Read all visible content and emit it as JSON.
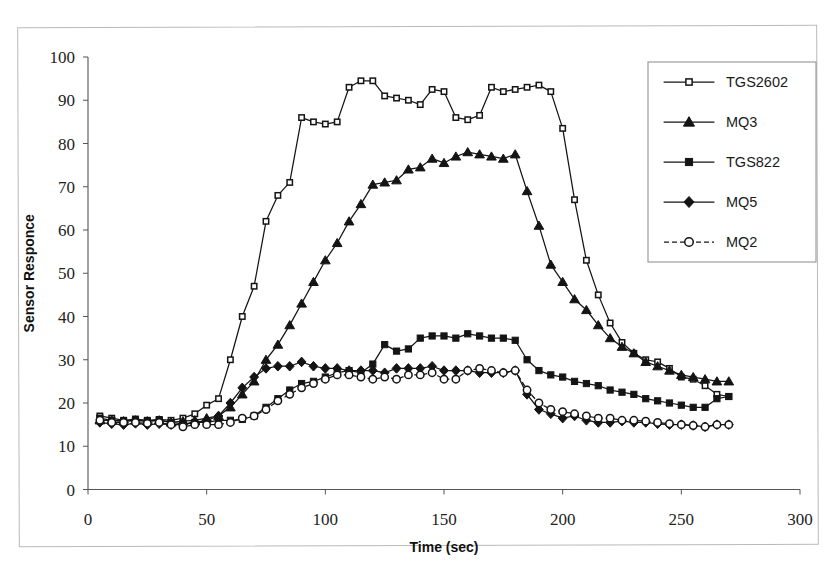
{
  "figure": {
    "name": "sensor-response-time-series",
    "has_outer_frame": true
  },
  "chart_data": {
    "type": "line",
    "title": "",
    "xlabel": "Time (sec)",
    "ylabel": "Sensor Responce",
    "xlim": [
      0,
      300
    ],
    "ylim": [
      0,
      100
    ],
    "xticks": [
      0,
      50,
      100,
      150,
      200,
      250,
      300
    ],
    "yticks": [
      0,
      10,
      20,
      30,
      40,
      50,
      60,
      70,
      80,
      90,
      100
    ],
    "grid": false,
    "legend_position": "upper-right-outside",
    "x": [
      5,
      10,
      15,
      20,
      25,
      30,
      35,
      40,
      45,
      50,
      55,
      60,
      65,
      70,
      75,
      80,
      85,
      90,
      95,
      100,
      105,
      110,
      115,
      120,
      125,
      130,
      135,
      140,
      145,
      150,
      155,
      160,
      165,
      170,
      175,
      180,
      185,
      190,
      195,
      200,
      205,
      210,
      215,
      220,
      225,
      230,
      235,
      240,
      245,
      250,
      255,
      260,
      265,
      270
    ],
    "series": [
      {
        "name": "TGS2602",
        "marker": "open-square",
        "linestyle": "solid",
        "color": "#141414",
        "values": [
          17,
          16.5,
          16,
          16.3,
          16,
          16.2,
          16,
          16.5,
          17.5,
          19.5,
          21,
          30,
          40,
          47,
          62,
          68,
          71,
          86,
          85,
          84.5,
          85,
          93,
          94.5,
          94.5,
          91,
          90.5,
          90,
          89,
          92.5,
          92,
          86,
          85.5,
          86.5,
          93,
          92,
          92.5,
          93,
          93.5,
          92,
          83.5,
          67,
          53,
          45,
          38.5,
          34,
          31.5,
          30,
          29.5,
          28,
          26,
          25.5,
          24,
          22,
          21.5
        ]
      },
      {
        "name": "MQ3",
        "marker": "filled-triangle",
        "linestyle": "solid",
        "color": "#141414",
        "values": [
          16,
          16,
          15.8,
          16,
          15.8,
          16,
          15.5,
          15.8,
          16,
          16.5,
          17,
          19,
          22,
          25,
          30,
          33.5,
          38,
          43,
          48,
          53,
          57,
          62,
          66,
          70.5,
          71,
          71.5,
          74,
          74.5,
          76.5,
          75.5,
          77,
          78,
          77.5,
          77,
          76.5,
          77.5,
          69,
          61,
          52,
          48,
          44,
          41.5,
          38,
          35,
          33,
          31.5,
          29.5,
          28.5,
          27.5,
          26.5,
          26,
          25.5,
          25,
          25
        ]
      },
      {
        "name": "TGS822",
        "marker": "filled-square",
        "linestyle": "solid",
        "color": "#141414",
        "values": [
          16.5,
          16,
          15.8,
          16,
          15.8,
          16,
          15.5,
          15.2,
          15.5,
          15.5,
          16,
          16,
          16.2,
          17,
          19,
          21,
          23,
          24.5,
          25,
          26,
          27,
          27.5,
          27,
          29,
          33.5,
          32,
          32.5,
          35,
          35.5,
          35.5,
          35,
          36,
          35.5,
          35,
          35,
          34.5,
          30,
          27.5,
          26.5,
          26,
          25,
          24.5,
          24,
          23,
          22.5,
          22,
          21,
          20.5,
          20,
          19.5,
          19,
          19,
          21,
          21.5
        ]
      },
      {
        "name": "MQ5",
        "marker": "filled-diamond",
        "linestyle": "solid",
        "color": "#141414",
        "values": [
          15.5,
          15.2,
          15,
          15.3,
          15,
          15.2,
          15,
          15,
          15.5,
          16,
          17,
          20,
          23.5,
          26,
          28,
          28.5,
          28.5,
          29.5,
          28.5,
          28,
          28,
          27.5,
          27.5,
          27.5,
          27,
          28,
          28,
          28,
          28.5,
          27.5,
          27.5,
          27.5,
          27,
          27,
          27,
          27.5,
          22,
          18.5,
          17.5,
          16.5,
          17,
          16,
          15.5,
          15.5,
          15.8,
          15.5,
          15.5,
          15.2,
          15,
          15,
          14.8,
          14.5,
          15,
          15
        ]
      },
      {
        "name": "MQ2",
        "marker": "open-circle",
        "linestyle": "dashed",
        "color": "#141414",
        "values": [
          16,
          15.5,
          15.5,
          15.5,
          15.3,
          15.5,
          15,
          14.5,
          15,
          15,
          15,
          15.5,
          16.5,
          17,
          18.5,
          20.5,
          22,
          23.5,
          24.5,
          25.5,
          26.5,
          26.5,
          26,
          25.5,
          26,
          25.5,
          26.5,
          26.5,
          27,
          25.5,
          25.5,
          27.5,
          28,
          27.5,
          27,
          27.5,
          23,
          20,
          18.5,
          18,
          17.5,
          17,
          16.5,
          16.5,
          16,
          16,
          15.8,
          15.5,
          15.2,
          15,
          14.8,
          14.5,
          15,
          15
        ]
      }
    ]
  },
  "legend": {
    "entries": [
      {
        "label": "TGS2602",
        "marker": "open-square",
        "linestyle": "solid"
      },
      {
        "label": "MQ3",
        "marker": "filled-triangle",
        "linestyle": "solid"
      },
      {
        "label": "TGS822",
        "marker": "filled-square",
        "linestyle": "solid"
      },
      {
        "label": "MQ5",
        "marker": "filled-diamond",
        "linestyle": "solid"
      },
      {
        "label": "MQ2",
        "marker": "open-circle",
        "linestyle": "dashed"
      }
    ]
  }
}
